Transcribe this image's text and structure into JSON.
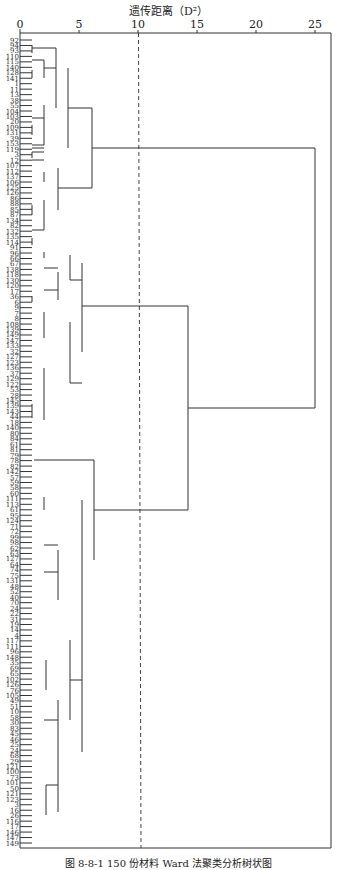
{
  "chart_data": {
    "type": "dendrogram",
    "title": "遗传距离（D²）",
    "xlabel": "遗传距离（D²）",
    "ylabel": "",
    "xlim": [
      0,
      25
    ],
    "x_ticks": [
      0,
      5,
      10,
      15,
      20,
      25
    ],
    "threshold_line": {
      "x": 10,
      "style": "dashed"
    },
    "leaf_count": 150,
    "leaves_sampled_top_to_bottom": [
      "92",
      "94",
      "93",
      "110",
      "115",
      "140",
      "128",
      "141",
      "1",
      "11",
      "13",
      "38",
      "55",
      "104",
      "103",
      "20",
      "109",
      "131",
      "39",
      "153",
      "119",
      "3",
      "12",
      "107",
      "112",
      "137",
      "106",
      "125",
      "126",
      "86",
      "88",
      "85",
      "87",
      "134",
      "82",
      "132",
      "135",
      "114",
      "91",
      "96",
      "66",
      "67",
      "138",
      "118",
      "130",
      "120",
      "17",
      "36",
      "6",
      "9",
      "7",
      "8",
      "108",
      "139",
      "149",
      "147",
      "133",
      "32",
      "127",
      "123",
      "136",
      "37",
      "129",
      "122",
      "53",
      "28",
      "145",
      "139",
      "143",
      "44",
      "18",
      "140",
      "80",
      "84",
      "61",
      "81",
      "79",
      "78",
      "82",
      "142",
      "57",
      "59",
      "58",
      "60",
      "111",
      "113",
      "61",
      "95",
      "124",
      "71",
      "72",
      "99",
      "98",
      "62",
      "63",
      "127",
      "64",
      "74",
      "75",
      "131",
      "48",
      "52",
      "40",
      "70",
      "24",
      "22",
      "31",
      "19",
      "14",
      "4",
      "117",
      "111",
      "96",
      "148",
      "35",
      "69",
      "65",
      "102",
      "126",
      "76",
      "105",
      "49",
      "51",
      "10",
      "58",
      "30",
      "83",
      "45",
      "46",
      "25",
      "24",
      "68",
      "29",
      "121",
      "100",
      "73",
      "101",
      "50",
      "121",
      "123",
      "3",
      "16",
      "26",
      "116",
      "17",
      "146",
      "147",
      "149"
    ],
    "clusters": [
      {
        "name": "Cluster A (top)",
        "leaf_range": [
          1,
          41
        ],
        "merge_height": 6.0
      },
      {
        "name": "Cluster B",
        "leaf_range": [
          42,
          77
        ],
        "merge_height": 5.8
      },
      {
        "name": "Cluster C",
        "leaf_range": [
          78,
          150
        ],
        "merge_height": 6.0
      }
    ],
    "major_merges": [
      {
        "join": [
          "Cluster B",
          "Cluster C"
        ],
        "height": 14.1
      },
      {
        "join": [
          "Cluster A",
          "B+C"
        ],
        "height": 25.0
      }
    ],
    "caption": "图 8-8-1  150 份材料 Ward 法聚类分析树状图"
  },
  "header": {
    "title": "遗传距离（D²）"
  },
  "axis": {
    "ticks": [
      "0",
      "5",
      "10",
      "15",
      "20",
      "25"
    ]
  },
  "footer": {
    "caption": "图 8-8-1  150 份材料 Ward 法聚类分析树状图"
  }
}
